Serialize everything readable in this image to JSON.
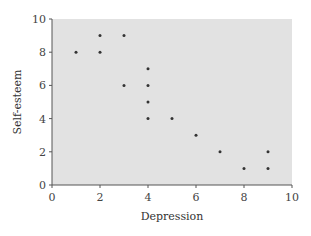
{
  "chart_data": {
    "type": "scatter",
    "title": "",
    "xlabel": "Depression",
    "ylabel": "Self-esteem",
    "xlim": [
      0,
      10
    ],
    "ylim": [
      0,
      10
    ],
    "xticks": [
      0,
      2,
      4,
      6,
      8,
      10
    ],
    "yticks": [
      0,
      2,
      4,
      6,
      8,
      10
    ],
    "grid": false,
    "legend": null,
    "points": [
      {
        "x": 1,
        "y": 8
      },
      {
        "x": 2,
        "y": 9
      },
      {
        "x": 2,
        "y": 8
      },
      {
        "x": 3,
        "y": 9
      },
      {
        "x": 3,
        "y": 6
      },
      {
        "x": 4,
        "y": 7
      },
      {
        "x": 4,
        "y": 6
      },
      {
        "x": 4,
        "y": 5
      },
      {
        "x": 4,
        "y": 4
      },
      {
        "x": 5,
        "y": 4
      },
      {
        "x": 6,
        "y": 3
      },
      {
        "x": 7,
        "y": 2
      },
      {
        "x": 8,
        "y": 1
      },
      {
        "x": 9,
        "y": 2
      },
      {
        "x": 9,
        "y": 1
      }
    ],
    "colors": {
      "plot_background": "#e2e2e2",
      "point": "#333333",
      "axis": "#555555"
    }
  }
}
